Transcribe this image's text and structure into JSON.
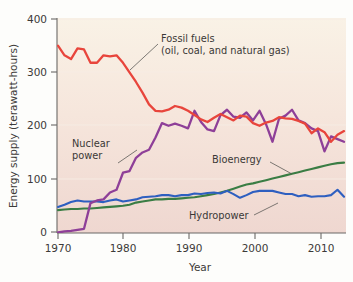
{
  "chart_data": {
    "type": "line",
    "title": "",
    "xlabel": "Year",
    "ylabel": "Energy supply (terawatt-hours)",
    "xlim": [
      1970,
      2014
    ],
    "ylim": [
      0,
      400
    ],
    "xticks": [
      1970,
      1980,
      1990,
      2000,
      2010
    ],
    "yticks": [
      0,
      100,
      200,
      300,
      400
    ],
    "xtick_labels": [
      "1970",
      "1980",
      "1990",
      "2000",
      "2010"
    ],
    "ytick_labels": [
      "0",
      "100",
      "200",
      "300",
      "400"
    ],
    "grid": "horizontal-faint",
    "legend": "inline-annotations",
    "plot_background_top": "#f8f0e4",
    "plot_background_bottom": "#f0d9d2",
    "x": [
      1970,
      1971,
      1972,
      1973,
      1974,
      1975,
      1976,
      1977,
      1978,
      1979,
      1980,
      1981,
      1982,
      1983,
      1984,
      1985,
      1986,
      1987,
      1988,
      1989,
      1990,
      1991,
      1992,
      1993,
      1994,
      1995,
      1996,
      1997,
      1998,
      1999,
      2000,
      2001,
      2002,
      2003,
      2004,
      2005,
      2006,
      2007,
      2008,
      2009,
      2010,
      2011,
      2012,
      2013,
      2014
    ],
    "series": [
      {
        "name": "Fossil fuels (oil, coal, and natural gas)",
        "color": "#e8453c",
        "values": [
          350,
          332,
          325,
          345,
          343,
          318,
          318,
          332,
          330,
          332,
          318,
          300,
          282,
          262,
          240,
          228,
          227,
          230,
          237,
          234,
          228,
          220,
          212,
          207,
          215,
          222,
          216,
          210,
          219,
          217,
          205,
          200,
          206,
          209,
          216,
          214,
          213,
          209,
          204,
          186,
          195,
          188,
          170,
          183,
          190
        ]
      },
      {
        "name": "Nuclear power",
        "color": "#8e3f98",
        "values": [
          0,
          2,
          3,
          5,
          7,
          55,
          60,
          62,
          75,
          80,
          112,
          115,
          140,
          150,
          155,
          178,
          205,
          200,
          204,
          200,
          195,
          228,
          207,
          193,
          190,
          220,
          230,
          217,
          215,
          225,
          210,
          228,
          203,
          170,
          213,
          219,
          230,
          210,
          205,
          195,
          190,
          152,
          180,
          175,
          170
        ]
      },
      {
        "name": "Bioenergy",
        "color": "#3a7d44",
        "values": [
          42,
          43,
          44,
          44,
          45,
          45,
          46,
          47,
          48,
          49,
          50,
          52,
          56,
          58,
          60,
          62,
          62,
          63,
          63,
          64,
          65,
          66,
          68,
          70,
          72,
          75,
          78,
          82,
          86,
          90,
          92,
          95,
          98,
          101,
          104,
          107,
          110,
          113,
          116,
          119,
          122,
          125,
          128,
          130,
          131
        ]
      },
      {
        "name": "Hydropower",
        "color": "#2e5fc0",
        "values": [
          48,
          52,
          57,
          60,
          58,
          58,
          58,
          57,
          60,
          62,
          58,
          60,
          62,
          66,
          67,
          68,
          70,
          70,
          68,
          70,
          70,
          73,
          72,
          74,
          75,
          73,
          78,
          72,
          65,
          70,
          76,
          78,
          78,
          78,
          75,
          72,
          72,
          68,
          70,
          67,
          68,
          68,
          70,
          80,
          67
        ]
      }
    ],
    "annotations": [
      {
        "id": "fossil-fuels",
        "line1": "Fossil fuels",
        "line2": "(oil, coal, and natural gas)"
      },
      {
        "id": "nuclear-power",
        "line1": "Nuclear",
        "line2": "power"
      },
      {
        "id": "bioenergy",
        "line1": "Bioenergy",
        "line2": ""
      },
      {
        "id": "hydropower",
        "line1": "Hydropower",
        "line2": ""
      }
    ]
  }
}
